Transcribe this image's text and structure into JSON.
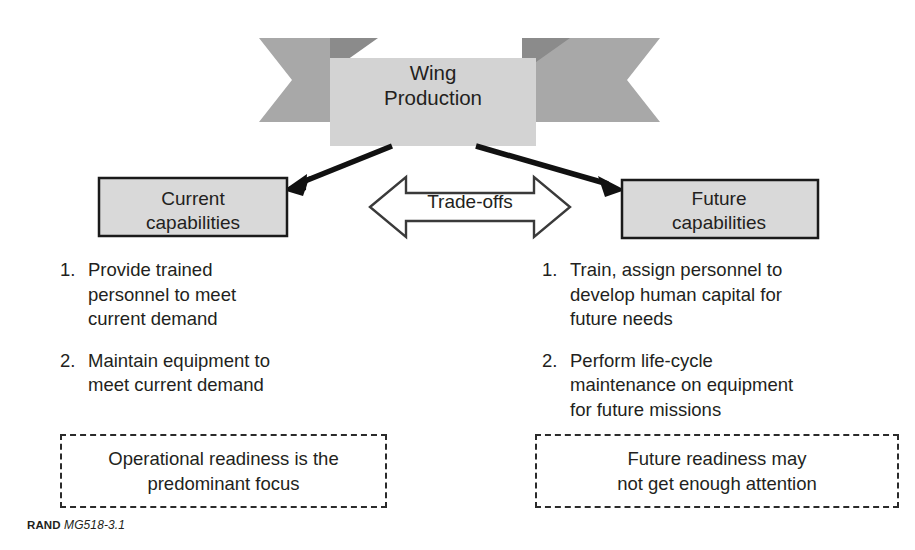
{
  "figure": {
    "banner": {
      "label": "Wing\nProduction",
      "fill": "#d2d2d2",
      "tail_fill": "#a8a8a8",
      "tail_shadow_fill": "#8d8d8d"
    },
    "boxes": [
      {
        "name": "current-capabilities",
        "label": "Current\ncapabilities",
        "fill": "#d9d9d9",
        "stroke": "#1a1a1a"
      },
      {
        "name": "future-capabilities",
        "label": "Future\ncapabilities",
        "fill": "#d9d9d9",
        "stroke": "#1a1a1a"
      }
    ],
    "tradeoff_arrow": {
      "label": "Trade-offs",
      "fill": "#ffffff",
      "stroke": "#3a3a3a"
    },
    "connector_arrows": [
      {
        "name": "arrow-to-current",
        "direction": "down-left"
      },
      {
        "name": "arrow-to-future",
        "direction": "down-right"
      }
    ],
    "lists": {
      "left": [
        {
          "number": "1.",
          "text": "Provide trained\npersonnel to meet\ncurrent demand"
        },
        {
          "number": "2.",
          "text": "Maintain equipment to\nmeet current demand"
        }
      ],
      "right": [
        {
          "number": "1.",
          "text": "Train, assign personnel to\ndevelop human capital for\nfuture needs"
        },
        {
          "number": "2.",
          "text": "Perform life-cycle\nmaintenance on equipment\nfor future missions"
        }
      ]
    },
    "callouts": {
      "left": "Operational readiness is the\npredominant focus",
      "right": "Future readiness may\nnot get enough attention"
    },
    "footer": {
      "brand": "RAND",
      "code": "MG518-3.1"
    }
  }
}
